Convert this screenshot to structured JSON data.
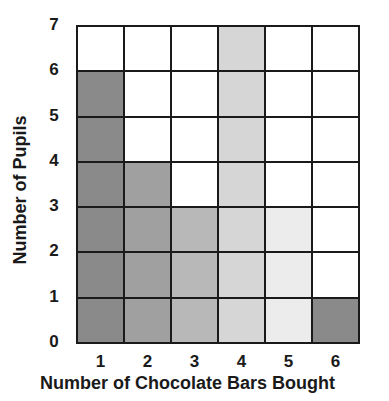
{
  "chart_data": {
    "type": "bar",
    "style": "shaded grid squares (pictogram-style bar chart)",
    "title": "",
    "xlabel": "Number of Chocolate Bars Bought",
    "ylabel": "Number of Pupils",
    "categories": [
      "1",
      "2",
      "3",
      "4",
      "5",
      "6"
    ],
    "values": [
      6,
      4,
      3,
      7,
      3,
      1
    ],
    "ylim": [
      0,
      7
    ],
    "yticks": [
      "0",
      "1",
      "2",
      "3",
      "4",
      "5",
      "6",
      "7"
    ],
    "grid": true,
    "legend": null,
    "colors": [
      "#8a8a8a",
      "#a0a0a0",
      "#b8b8b8",
      "#d6d6d6",
      "#ececec",
      "#8a8a8a"
    ]
  },
  "axis": {
    "xlabel": "Number of Chocolate Bars Bought",
    "ylabel": "Number of Pupils"
  }
}
